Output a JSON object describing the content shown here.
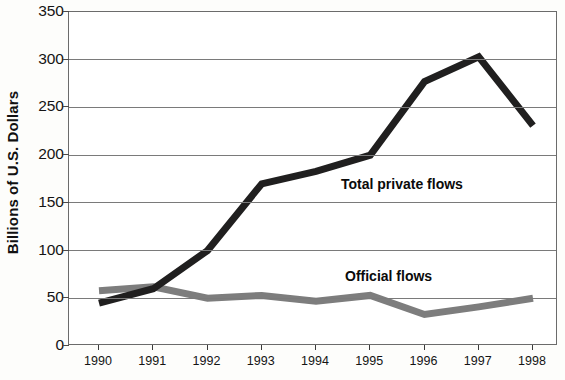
{
  "chart_data": {
    "type": "line",
    "title": "",
    "subtitle": "",
    "xlabel": "",
    "ylabel": "Billions of U.S. Dollars",
    "categories": [
      "1990",
      "1991",
      "1992",
      "1993",
      "1994",
      "1995",
      "1996",
      "1997",
      "1998"
    ],
    "x": [
      1990,
      1991,
      1992,
      1993,
      1994,
      1995,
      1996,
      1997,
      1998
    ],
    "xlim": [
      1990,
      1998
    ],
    "ylim": [
      0,
      350
    ],
    "yticks": [
      0,
      50,
      100,
      150,
      200,
      250,
      300,
      350
    ],
    "ytick_labels": [
      "0",
      "50",
      "100",
      "150",
      "200",
      "250",
      "300",
      "350"
    ],
    "grid": "horizontal",
    "legend_position": "inline-annotations",
    "series": [
      {
        "name": "Total private flows",
        "color": "#201f1f",
        "line_width": 7,
        "values": [
          45,
          60,
          100,
          170,
          183,
          200,
          277,
          303,
          231
        ]
      },
      {
        "name": "Official flows",
        "color": "#7d7d7d",
        "line_width": 7,
        "values": [
          58,
          62,
          50,
          53,
          47,
          53,
          33,
          41,
          50
        ]
      }
    ],
    "annotations": [
      {
        "text": "Total private flows",
        "series": "Total private flows"
      },
      {
        "text": "Official flows",
        "series": "Official flows"
      }
    ]
  },
  "colors": {
    "private_flows": "#201f1f",
    "official_flows": "#7d7d7d",
    "axis": "#6b6b6b",
    "gridline": "#7a7a7a",
    "text": "#141414",
    "background": "#ffffff"
  }
}
